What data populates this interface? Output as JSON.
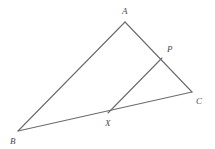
{
  "figure": {
    "background_color": "#ffffff",
    "line_color": "#6b6b70",
    "label_color": "#4a4a50",
    "stroke_width": 1.1,
    "width": 215,
    "height": 149
  },
  "points": {
    "A": {
      "label": "A",
      "x": 125,
      "y": 22,
      "label_x": 122,
      "label_y": 14
    },
    "B": {
      "label": "B",
      "x": 18,
      "y": 131,
      "label_x": 10,
      "label_y": 144
    },
    "C": {
      "label": "C",
      "x": 192,
      "y": 92,
      "label_x": 196,
      "label_y": 104
    },
    "P": {
      "label": "P",
      "x": 162,
      "y": 58,
      "label_x": 167,
      "label_y": 52
    },
    "X": {
      "label": "X",
      "x": 108,
      "y": 113,
      "label_x": 105,
      "label_y": 126
    }
  },
  "segments": [
    {
      "name": "segment-AB",
      "from": "A",
      "to": "B",
      "x1": 125,
      "y1": 22,
      "x2": 18,
      "y2": 131
    },
    {
      "name": "segment-AC",
      "from": "A",
      "to": "C",
      "x1": 125,
      "y1": 22,
      "x2": 192,
      "y2": 92
    },
    {
      "name": "segment-BC",
      "from": "B",
      "to": "C",
      "x1": 18,
      "y1": 131,
      "x2": 192,
      "y2": 92
    },
    {
      "name": "segment-XP",
      "from": "X",
      "to": "P",
      "x1": 108,
      "y1": 113,
      "x2": 162,
      "y2": 58
    }
  ]
}
